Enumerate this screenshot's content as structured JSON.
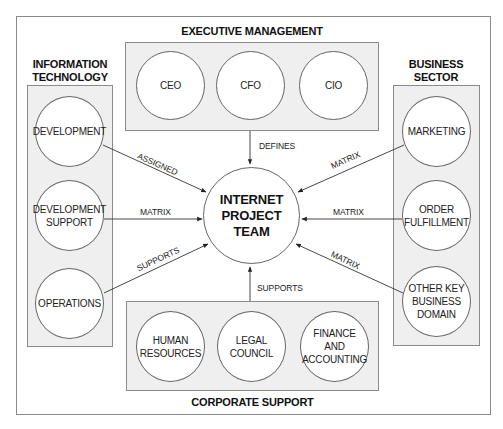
{
  "diagram": {
    "center": {
      "label_lines": [
        "INTERNET",
        "PROJECT",
        "TEAM"
      ]
    },
    "groups": {
      "executive": {
        "title": "EXECUTIVE MANAGEMENT",
        "nodes": [
          {
            "label": "CEO"
          },
          {
            "label": "CFO"
          },
          {
            "label": "CIO"
          }
        ]
      },
      "it": {
        "title_lines": [
          "INFORMATION",
          "TECHNOLOGY"
        ],
        "nodes": [
          {
            "label": "DEVELOPMENT"
          },
          {
            "label_lines": [
              "DEVELOPMENT",
              "SUPPORT"
            ]
          },
          {
            "label": "OPERATIONS"
          }
        ]
      },
      "business": {
        "title_lines": [
          "BUSINESS",
          "SECTOR"
        ],
        "nodes": [
          {
            "label": "MARKETING"
          },
          {
            "label_lines": [
              "ORDER",
              "FULFILLMENT"
            ]
          },
          {
            "label_lines": [
              "OTHER KEY",
              "BUSINESS",
              "DOMAIN"
            ]
          }
        ]
      },
      "corporate": {
        "title": "CORPORATE SUPPORT",
        "nodes": [
          {
            "label_lines": [
              "HUMAN",
              "RESOURCES"
            ]
          },
          {
            "label_lines": [
              "LEGAL",
              "COUNCIL"
            ]
          },
          {
            "label_lines": [
              "FINANCE",
              "AND",
              "ACCOUNTING"
            ]
          }
        ]
      }
    },
    "edges": [
      {
        "from": "EXECUTIVE MANAGEMENT",
        "to": "INTERNET PROJECT TEAM",
        "label": "DEFINES"
      },
      {
        "from": "DEVELOPMENT",
        "to": "INTERNET PROJECT TEAM",
        "label": "ASSIGNED"
      },
      {
        "from": "DEVELOPMENT SUPPORT",
        "to": "INTERNET PROJECT TEAM",
        "label": "MATRIX"
      },
      {
        "from": "OPERATIONS",
        "to": "INTERNET PROJECT TEAM",
        "label": "SUPPORTS"
      },
      {
        "from": "MARKETING",
        "to": "INTERNET PROJECT TEAM",
        "label": "MATRIX"
      },
      {
        "from": "ORDER FULFILLMENT",
        "to": "INTERNET PROJECT TEAM",
        "label": "MATRIX"
      },
      {
        "from": "OTHER KEY BUSINESS DOMAIN",
        "to": "INTERNET PROJECT TEAM",
        "label": "MATRIX"
      },
      {
        "from": "CORPORATE SUPPORT",
        "to": "INTERNET PROJECT TEAM",
        "label": "SUPPORTS"
      }
    ]
  }
}
